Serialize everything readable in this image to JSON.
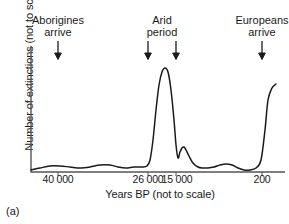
{
  "figure": {
    "caption": "(a)",
    "ylabel": "Number of extinctions (not to scale)",
    "xlabel": "Years BP (not to scale)"
  },
  "annotations": {
    "aborigines": {
      "line1": "Aborigines",
      "line2": "arrive"
    },
    "arid": {
      "line1": "Arid",
      "line2": "period"
    },
    "europeans": {
      "line1": "Europeans",
      "line2": "arrive"
    }
  },
  "ticks": {
    "t1": "40 000",
    "t2": "26 000",
    "t3": "15 000",
    "t4": "200"
  },
  "chart_data": {
    "type": "line",
    "title": "",
    "xlabel": "Years BP (not to scale)",
    "ylabel": "Number of extinctions (not to scale)",
    "grid": false,
    "legend": false,
    "axis_style": "L-shaped spine, left and bottom only",
    "line_color": "#1a1a1a",
    "tick_values": [
      "40 000",
      "26 000",
      "15 000",
      "200"
    ],
    "tick_x_px": [
      58,
      148,
      176,
      262
    ],
    "x_axis_note": "Years Before Present, reversed and not to scale",
    "y_axis_note": "Relative number of extinctions, not to scale, no numeric ticks",
    "events": [
      {
        "label": "Aborigines arrive",
        "x_px": 58,
        "arrows": 1
      },
      {
        "label": "Arid period",
        "x_px": [
          148,
          176
        ],
        "arrows": 2
      },
      {
        "label": "Europeans arrive",
        "x_px": 262,
        "arrows": 1
      }
    ],
    "series": [
      {
        "name": "Number of extinctions",
        "description": "Low undulating baseline through the early period, a very large narrow peak just after 26 000 BP during the arid period, a small secondary bump near 15 000 BP, a low wavy baseline after, then a steep rise at the far right as Europeans arrive.",
        "points_px": [
          [
            31,
            170
          ],
          [
            40,
            168
          ],
          [
            50,
            166
          ],
          [
            60,
            166
          ],
          [
            70,
            167
          ],
          [
            80,
            168
          ],
          [
            90,
            167
          ],
          [
            100,
            165
          ],
          [
            110,
            165
          ],
          [
            118,
            167
          ],
          [
            126,
            168
          ],
          [
            134,
            167
          ],
          [
            142,
            167
          ],
          [
            147,
            166
          ],
          [
            150,
            160
          ],
          [
            153,
            140
          ],
          [
            156,
            110
          ],
          [
            159,
            85
          ],
          [
            162,
            72
          ],
          [
            165,
            68
          ],
          [
            168,
            72
          ],
          [
            171,
            90
          ],
          [
            174,
            120
          ],
          [
            176,
            145
          ],
          [
            178,
            158
          ],
          [
            180,
            152
          ],
          [
            182,
            148
          ],
          [
            184,
            147
          ],
          [
            186,
            150
          ],
          [
            189,
            156
          ],
          [
            193,
            163
          ],
          [
            198,
            167
          ],
          [
            203,
            168
          ],
          [
            208,
            168
          ],
          [
            214,
            167
          ],
          [
            220,
            165
          ],
          [
            226,
            164
          ],
          [
            232,
            165
          ],
          [
            238,
            168
          ],
          [
            244,
            170
          ],
          [
            250,
            170
          ],
          [
            256,
            168
          ],
          [
            261,
            160
          ],
          [
            265,
            130
          ],
          [
            268,
            100
          ],
          [
            272,
            88
          ],
          [
            276,
            84
          ]
        ],
        "approx_values": [
          {
            "x_label": "40 000",
            "y_relative": 0.04
          },
          {
            "x_label": "26 000",
            "y_relative": 0.04
          },
          {
            "x_label": "peak (~24 000)",
            "y_relative": 1.0
          },
          {
            "x_label": "15 000",
            "y_relative": 0.18
          },
          {
            "x_label": "secondary bump",
            "y_relative": 0.2
          },
          {
            "x_label": "200",
            "y_relative": 0.06
          },
          {
            "x_label": "present",
            "y_relative": 0.85
          }
        ]
      }
    ]
  }
}
